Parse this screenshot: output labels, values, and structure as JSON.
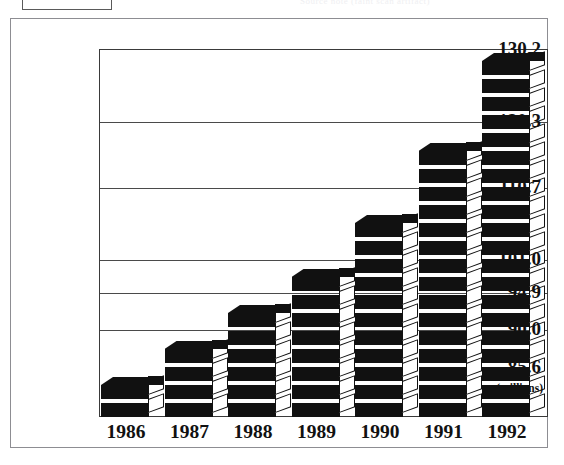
{
  "artifacts": {
    "top_partial_box_label": "",
    "top_ghost_caption": "Source note (faint scan artifact)"
  },
  "chart_data": {
    "type": "bar",
    "title": "",
    "subtitle": "",
    "xlabel": "",
    "ylabel": "(millions)",
    "categories": [
      "1986",
      "1987",
      "1988",
      "1989",
      "1990",
      "1991",
      "1992"
    ],
    "values": [
      85.6,
      90.0,
      94.9,
      101.0,
      110.7,
      120.3,
      130.2
    ],
    "ytick_labels": [
      "130.2",
      "120.3",
      "110.7",
      "101.0",
      "94.9",
      "90.0",
      "85.6"
    ],
    "ytick_values": [
      130.2,
      120.3,
      110.7,
      101.0,
      94.9,
      90.0,
      85.6
    ],
    "ylim": [
      78.0,
      133.0
    ],
    "grid": true,
    "legend": "none",
    "bar_style": "stacked-3d-slabs",
    "series": [
      {
        "name": "Value",
        "values": [
          85.6,
          90.0,
          94.9,
          101.0,
          110.7,
          120.3,
          130.2
        ]
      }
    ],
    "colors": {
      "bar_fill": "#111111",
      "bar_side": "#ffffff",
      "gridline": "#4a4a4a",
      "frame": "#8d8d92",
      "plot_border": "#3a3a3a",
      "background": "#ffffff",
      "text": "#111111"
    },
    "bar_tops_px": [
      363,
      325,
      285,
      255,
      185,
      113,
      33
    ],
    "slab_counts": [
      2,
      4,
      6,
      8,
      11,
      15,
      20
    ]
  }
}
